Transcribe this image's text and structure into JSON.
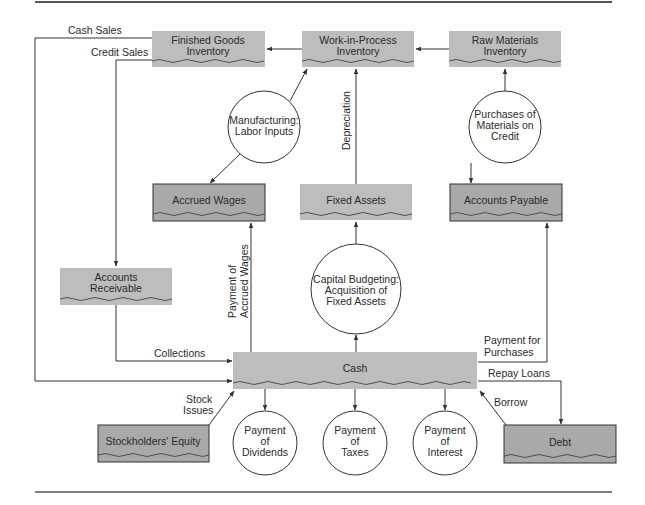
{
  "diagram": {
    "nodes": {
      "finished_goods": [
        "Finished Goods",
        "Inventory"
      ],
      "work_in_process": [
        "Work-in-Process",
        "Inventory"
      ],
      "raw_materials": [
        "Raw Materials",
        "Inventory"
      ],
      "manufacturing": [
        "Manufacturing:",
        "Labor Inputs"
      ],
      "purchases": [
        "Purchases of",
        "Materials on",
        "Credit"
      ],
      "accrued_wages": "Accrued Wages",
      "fixed_assets": "Fixed Assets",
      "accounts_payable": "Accounts Payable",
      "accounts_receivable": [
        "Accounts",
        "Receivable"
      ],
      "capital_budgeting": [
        "Capital Budgeting:",
        "Acquisition of",
        "Fixed Assets"
      ],
      "cash": "Cash",
      "stockholders_equity": "Stockholders' Equity",
      "dividends": [
        "Payment",
        "of",
        "Dividends"
      ],
      "taxes": [
        "Payment",
        "of",
        "Taxes"
      ],
      "interest": [
        "Payment",
        "of",
        "Interest"
      ],
      "debt": "Debt"
    },
    "flows": {
      "cash_sales": "Cash Sales",
      "credit_sales": "Credit Sales",
      "depreciation": "Depreciation",
      "payment_accrued_wages": [
        "Payment of",
        "Accrued Wages"
      ],
      "collections": "Collections",
      "payment_purchases": [
        "Payment for",
        "Purchases"
      ],
      "repay_loans": "Repay Loans",
      "borrow": "Borrow",
      "stock_issues": [
        "Stock",
        "Issues"
      ]
    },
    "colors": {
      "light_box": "#bdbdbd",
      "dark_box": "#a9a9a9",
      "line": "#333333"
    }
  }
}
